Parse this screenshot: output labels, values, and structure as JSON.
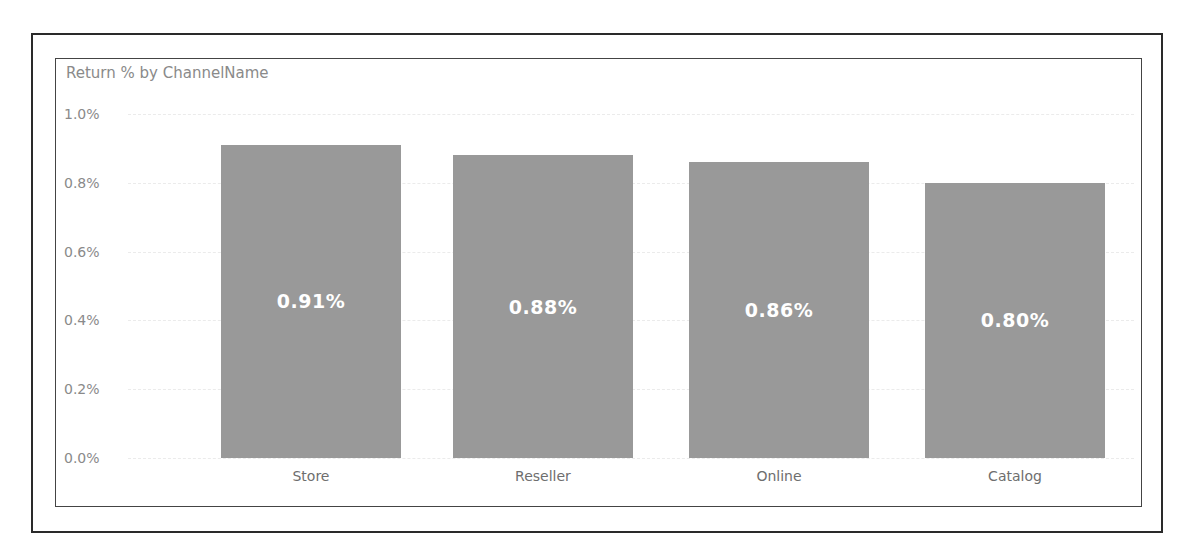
{
  "chart_data": {
    "type": "bar",
    "title": "Return % by ChannelName",
    "categories": [
      "Store",
      "Reseller",
      "Online",
      "Catalog"
    ],
    "values": [
      0.91,
      0.88,
      0.86,
      0.8
    ],
    "data_labels": [
      "0.91%",
      "0.88%",
      "0.86%",
      "0.80%"
    ],
    "xlabel": "",
    "ylabel": "",
    "ylim": [
      0,
      1.0
    ],
    "yticks": [
      "1.0%",
      "0.8%",
      "0.6%",
      "0.4%",
      "0.2%",
      "0.0%"
    ],
    "grid": true,
    "legend": "none",
    "bar_color": "#999999"
  }
}
